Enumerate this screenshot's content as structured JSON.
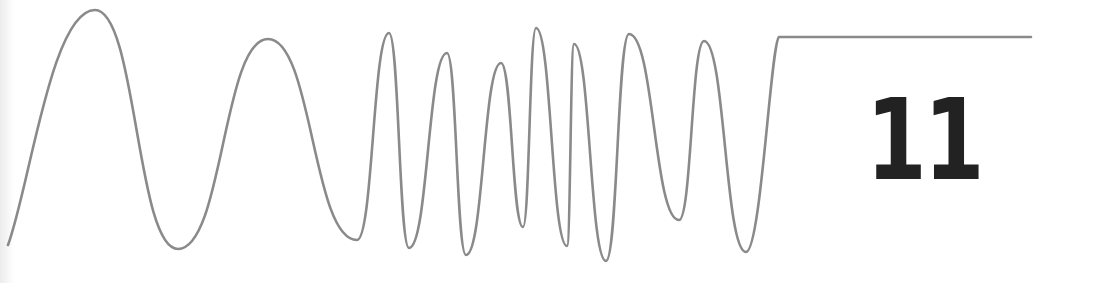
{
  "figure": {
    "number_label": "11",
    "line_color": "#8a8a8a",
    "number_color": "#222222",
    "background": "#ffffff"
  },
  "chart_data": {
    "type": "line",
    "title": "",
    "xlabel": "",
    "ylabel": "",
    "grid": false,
    "legend": null,
    "points_px": [
      [
        8,
        245
      ],
      [
        95,
        10
      ],
      [
        178,
        249
      ],
      [
        268,
        39
      ],
      [
        357,
        240
      ],
      [
        389,
        33
      ],
      [
        409,
        248
      ],
      [
        447,
        53
      ],
      [
        466,
        255
      ],
      [
        501,
        63
      ],
      [
        523,
        227
      ],
      [
        536,
        28
      ],
      [
        567,
        246
      ],
      [
        574,
        44
      ],
      [
        606,
        261
      ],
      [
        629,
        34
      ],
      [
        679,
        220
      ],
      [
        704,
        41
      ],
      [
        746,
        252
      ],
      [
        779,
        37
      ],
      [
        1031,
        37
      ]
    ]
  }
}
